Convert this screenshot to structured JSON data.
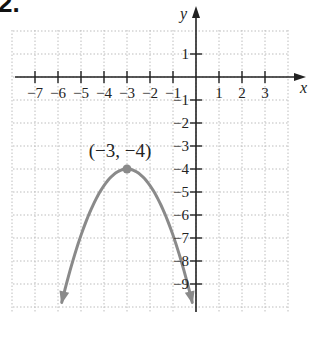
{
  "problem": {
    "number": "2."
  },
  "chart_data": {
    "type": "line",
    "title": "",
    "xlabel": "x",
    "ylabel": "y",
    "xlim": [
      -8,
      4
    ],
    "ylim": [
      -10,
      2
    ],
    "grid": true,
    "x_ticks": [
      -7,
      -6,
      -5,
      -4,
      -3,
      -2,
      -1,
      1,
      2,
      3
    ],
    "x_tick_labels": [
      "−7",
      "−6",
      "−5",
      "−4",
      "−3",
      "−2",
      "−1",
      "1",
      "2",
      "3"
    ],
    "y_ticks": [
      1,
      -1,
      -2,
      -3,
      -4,
      -5,
      -6,
      -7,
      -8,
      -9
    ],
    "y_tick_labels": [
      "1",
      "−1",
      "−2",
      "−3",
      "−4",
      "−5",
      "−6",
      "−7",
      "−8",
      "−9"
    ],
    "series": [
      {
        "name": "parabola",
        "shape": "downward-opening parabola with arrows on both ends",
        "vertex": [
          -3,
          -4
        ],
        "approx_equation": "y = -0.72(x + 3)^2 - 4",
        "color": "#8a8a8a",
        "points": [
          [
            -5.7,
            -9.8
          ],
          [
            -5,
            -6.9
          ],
          [
            -4,
            -4.7
          ],
          [
            -3,
            -4
          ],
          [
            -2,
            -4.7
          ],
          [
            -1,
            -6.9
          ],
          [
            -0.3,
            -9.8
          ]
        ]
      }
    ],
    "annotations": [
      {
        "text": "(−3, −4)",
        "point": [
          -3,
          -4
        ],
        "marker": "filled-dot"
      }
    ],
    "colors": {
      "curve": "#8a8a8a",
      "axes": "#222222",
      "grid": "#bdbdbd"
    }
  }
}
